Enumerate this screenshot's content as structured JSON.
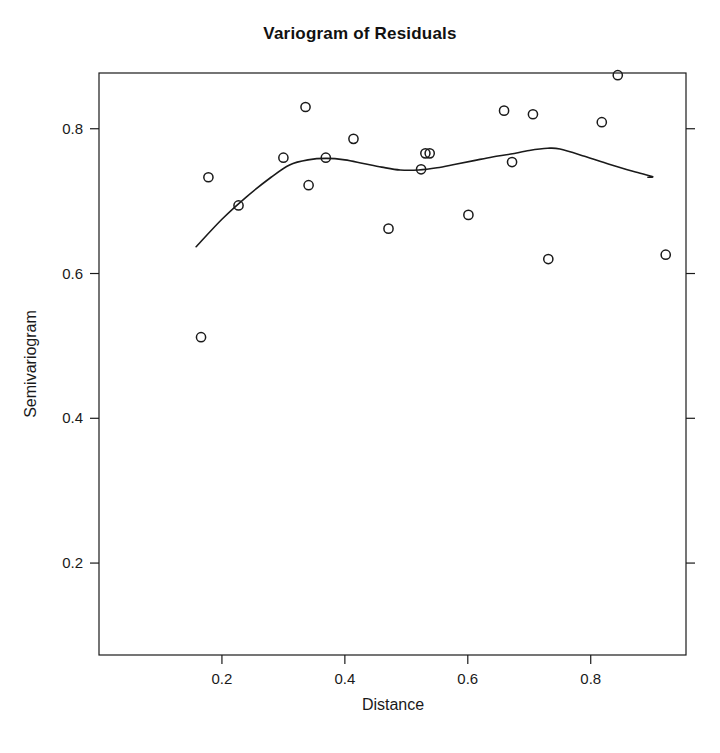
{
  "figure": {
    "title": "Variogram of Residuals",
    "background_color": "#ffffff",
    "foreground_color": "#1a1a1a"
  },
  "chart_data": {
    "type": "scatter",
    "title": "Variogram of Residuals",
    "xlabel": "Distance",
    "ylabel": "Semivariogram",
    "xlim": [
      0.0,
      0.955
    ],
    "ylim": [
      0.073,
      0.877
    ],
    "grid": false,
    "legend": null,
    "xticks": [
      0.2,
      0.4,
      0.6,
      0.8
    ],
    "xtick_labels": [
      "0.2",
      "0.4",
      "0.6",
      "0.8"
    ],
    "yticks": [
      0.2,
      0.4,
      0.6,
      0.8
    ],
    "ytick_labels": [
      "0.2",
      "0.4",
      "0.6",
      "0.8"
    ],
    "marker": "open-circle",
    "marker_color": "#1a1a1a",
    "line_color": "#1a1a1a",
    "series": [
      {
        "name": "Empirical semivariance",
        "type": "scatter",
        "points": [
          {
            "x": 0.166,
            "y": 0.512
          },
          {
            "x": 0.178,
            "y": 0.733
          },
          {
            "x": 0.227,
            "y": 0.694
          },
          {
            "x": 0.3,
            "y": 0.76
          },
          {
            "x": 0.336,
            "y": 0.83
          },
          {
            "x": 0.341,
            "y": 0.722
          },
          {
            "x": 0.369,
            "y": 0.76
          },
          {
            "x": 0.414,
            "y": 0.786
          },
          {
            "x": 0.471,
            "y": 0.662
          },
          {
            "x": 0.524,
            "y": 0.744
          },
          {
            "x": 0.531,
            "y": 0.766
          },
          {
            "x": 0.538,
            "y": 0.766
          },
          {
            "x": 0.601,
            "y": 0.681
          },
          {
            "x": 0.659,
            "y": 0.825
          },
          {
            "x": 0.672,
            "y": 0.754
          },
          {
            "x": 0.706,
            "y": 0.82
          },
          {
            "x": 0.731,
            "y": 0.62
          },
          {
            "x": 0.818,
            "y": 0.809
          },
          {
            "x": 0.844,
            "y": 0.874
          },
          {
            "x": 0.922,
            "y": 0.626
          }
        ]
      },
      {
        "name": "Lowess smooth",
        "type": "line",
        "points": [
          {
            "x": 0.158,
            "y": 0.637
          },
          {
            "x": 0.2,
            "y": 0.675
          },
          {
            "x": 0.24,
            "y": 0.706
          },
          {
            "x": 0.28,
            "y": 0.733
          },
          {
            "x": 0.31,
            "y": 0.75
          },
          {
            "x": 0.34,
            "y": 0.757
          },
          {
            "x": 0.37,
            "y": 0.759
          },
          {
            "x": 0.4,
            "y": 0.757
          },
          {
            "x": 0.43,
            "y": 0.752
          },
          {
            "x": 0.46,
            "y": 0.747
          },
          {
            "x": 0.49,
            "y": 0.743
          },
          {
            "x": 0.52,
            "y": 0.743
          },
          {
            "x": 0.55,
            "y": 0.746
          },
          {
            "x": 0.58,
            "y": 0.751
          },
          {
            "x": 0.61,
            "y": 0.756
          },
          {
            "x": 0.64,
            "y": 0.761
          },
          {
            "x": 0.67,
            "y": 0.765
          },
          {
            "x": 0.7,
            "y": 0.77
          },
          {
            "x": 0.73,
            "y": 0.773
          },
          {
            "x": 0.75,
            "y": 0.772
          },
          {
            "x": 0.79,
            "y": 0.762
          },
          {
            "x": 0.83,
            "y": 0.751
          },
          {
            "x": 0.87,
            "y": 0.741
          },
          {
            "x": 0.9,
            "y": 0.734
          },
          {
            "x": 0.893,
            "y": 0.733
          }
        ]
      }
    ]
  }
}
